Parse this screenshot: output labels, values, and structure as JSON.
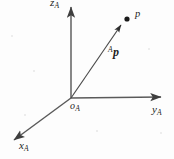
{
  "figure": {
    "kind": "3d-coordinate-frame-diagram",
    "width": 174,
    "height": 159,
    "background_color": "#fdfdfd",
    "stroke_color": "#4a4a4a",
    "text_color": "#1c1c1c"
  },
  "labels": {
    "z_axis": {
      "base": "z",
      "subscript": "A"
    },
    "y_axis": {
      "base": "y",
      "subscript": "A"
    },
    "x_axis": {
      "base": "x",
      "subscript": "A"
    },
    "origin": {
      "base": "o",
      "subscript": "A"
    },
    "point": {
      "base": "p"
    },
    "vector": {
      "superscript": "A",
      "base": "p"
    }
  },
  "geometry": {
    "origin": {
      "x": 71,
      "y": 98
    },
    "z_axis_tip": {
      "x": 71,
      "y": 4
    },
    "y_axis_tip": {
      "x": 166,
      "y": 97
    },
    "x_axis_tip": {
      "x": 9,
      "y": 143
    },
    "point_marker": {
      "x": 127,
      "y": 19,
      "radius": 2.6
    },
    "vector_tip": {
      "x": 122,
      "y": 24
    }
  }
}
